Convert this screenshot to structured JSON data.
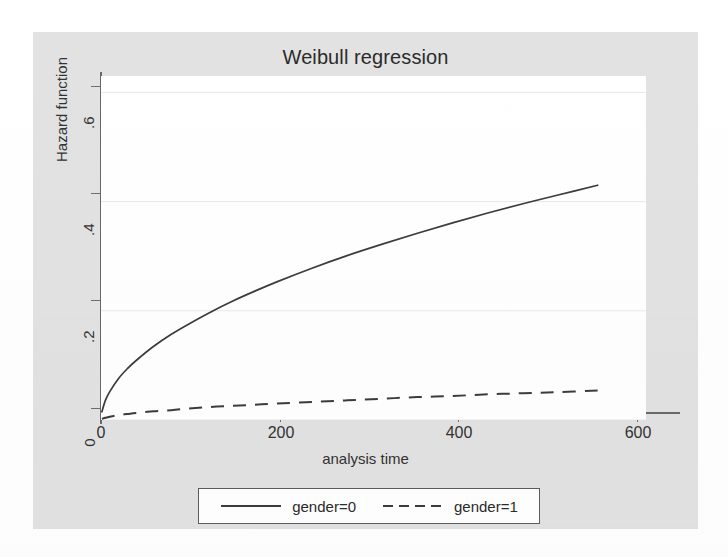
{
  "chart_data": {
    "type": "line",
    "title": "Weibull regression",
    "xlabel": "analysis time",
    "ylabel": "Hazard function",
    "xlim": [
      0,
      620
    ],
    "ylim": [
      0,
      0.63
    ],
    "xticks": [
      0,
      200,
      400,
      600
    ],
    "xticklabels": [
      "0",
      "200",
      "400",
      "600"
    ],
    "yticks": [
      0,
      0.2,
      0.4,
      0.6
    ],
    "yticklabels": [
      "0",
      ".2",
      ".4",
      ".6"
    ],
    "grid": "horizontal",
    "legend_position": "bottom",
    "series": [
      {
        "name": "gender=0",
        "style": "solid",
        "color": "#3c3c3c",
        "x": [
          1,
          5,
          10,
          20,
          30,
          40,
          60,
          80,
          100,
          125,
          150,
          175,
          200,
          240,
          280,
          320,
          360,
          400,
          440,
          480,
          520,
          565
        ],
        "y": [
          0.015,
          0.036,
          0.052,
          0.076,
          0.094,
          0.109,
          0.135,
          0.157,
          0.176,
          0.198,
          0.218,
          0.236,
          0.253,
          0.278,
          0.301,
          0.322,
          0.342,
          0.361,
          0.379,
          0.396,
          0.412,
          0.43
        ]
      },
      {
        "name": "gender=1",
        "style": "dashed",
        "color": "#3c3c3c",
        "x": [
          1,
          5,
          10,
          20,
          30,
          40,
          60,
          80,
          100,
          125,
          150,
          175,
          200,
          240,
          280,
          320,
          360,
          400,
          440,
          480,
          520,
          565
        ],
        "y": [
          0.002,
          0.004,
          0.006,
          0.009,
          0.011,
          0.013,
          0.016,
          0.018,
          0.021,
          0.024,
          0.026,
          0.028,
          0.03,
          0.033,
          0.036,
          0.039,
          0.042,
          0.044,
          0.047,
          0.049,
          0.051,
          0.054
        ]
      }
    ]
  },
  "legend": {
    "entries": [
      {
        "label": "gender=0",
        "style": "solid"
      },
      {
        "label": "gender=1",
        "style": "dashed"
      }
    ]
  }
}
